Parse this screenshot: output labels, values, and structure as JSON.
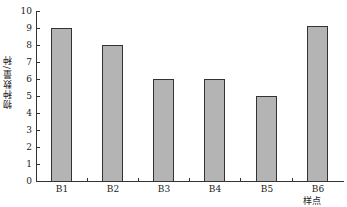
{
  "chart_data": {
    "type": "bar",
    "title": "",
    "xlabel": "样点",
    "ylabel": "物种数量/种",
    "categories": [
      "B1",
      "B2",
      "B3",
      "B4",
      "B5",
      "B6"
    ],
    "values": [
      9,
      8,
      6,
      6,
      5,
      9.1
    ],
    "ylim": [
      0,
      10
    ],
    "yticks": [
      "0",
      "1",
      "2",
      "3",
      "4",
      "5",
      "6",
      "7",
      "8",
      "9",
      "10"
    ],
    "grid": false,
    "bar_color": "#b4b4b4"
  }
}
